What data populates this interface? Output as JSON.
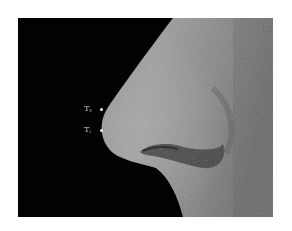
{
  "figure": {
    "annotations": [
      {
        "label": "T",
        "subscript": "s"
      },
      {
        "label": "T",
        "subscript": "i"
      }
    ],
    "colors": {
      "background": "#020202",
      "skin_light": "#a8a8a8",
      "skin_dark": "#5a5a5a",
      "marker": "#f0f0f0"
    }
  }
}
